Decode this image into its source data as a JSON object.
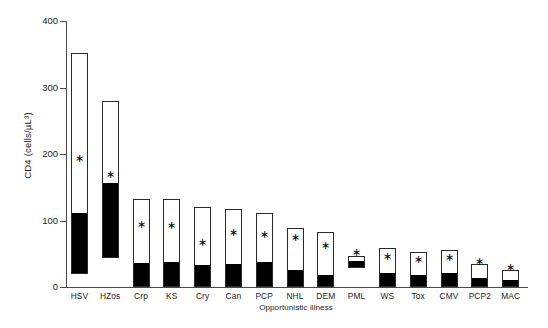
{
  "chart_data": {
    "type": "bar",
    "title": "",
    "xlabel": "Opportunistic illness",
    "ylabel": "CD4 (cells/µL³)",
    "ylim": [
      0,
      400
    ],
    "yticks": [
      0,
      100,
      200,
      300,
      400
    ],
    "grid": false,
    "legend": null,
    "note": "Floating stacked bars: each bar spans from a lower quartile to an upper value; the solid black segment spans lower value to median, the open (white) segment spans median to upper value. The asterisk marks the median CD4 marker for each illness.",
    "categories": [
      "HSV",
      "HZos",
      "Crp",
      "KS",
      "Cry",
      "Can",
      "PCP",
      "NHL",
      "DEM",
      "PML",
      "WS",
      "Tox",
      "CMV",
      "PCP2",
      "MAC"
    ],
    "series": [
      {
        "name": "upper (top of open bar)",
        "values": [
          352,
          280,
          132,
          132,
          120,
          117,
          112,
          88,
          82,
          47,
          58,
          53,
          56,
          34,
          25
        ]
      },
      {
        "name": "median (top of black segment)",
        "values": [
          110,
          155,
          34,
          36,
          32,
          33,
          36,
          24,
          17,
          37,
          20,
          17,
          19,
          12,
          9
        ]
      },
      {
        "name": "lower (bottom of bar)",
        "values": [
          20,
          44,
          0,
          0,
          0,
          0,
          0,
          0,
          0,
          28,
          0,
          0,
          0,
          0,
          0
        ]
      }
    ],
    "star_values": [
      193,
      168,
      94,
      92,
      66,
      81,
      78,
      73,
      62,
      51,
      45,
      41,
      44,
      37,
      29
    ]
  },
  "axis": {
    "y_tick_labels": [
      "400",
      "300",
      "200",
      "100",
      "0"
    ],
    "x_tick_labels": [
      "HSV",
      "HZos",
      "Crp",
      "KS",
      "Cry",
      "Can",
      "PCP",
      "NHL",
      "DEM",
      "PML",
      "WS",
      "Tox",
      "CMV",
      "PCP2",
      "MAC"
    ]
  },
  "icons": {
    "star_glyph": "∗"
  },
  "footer_text": ""
}
